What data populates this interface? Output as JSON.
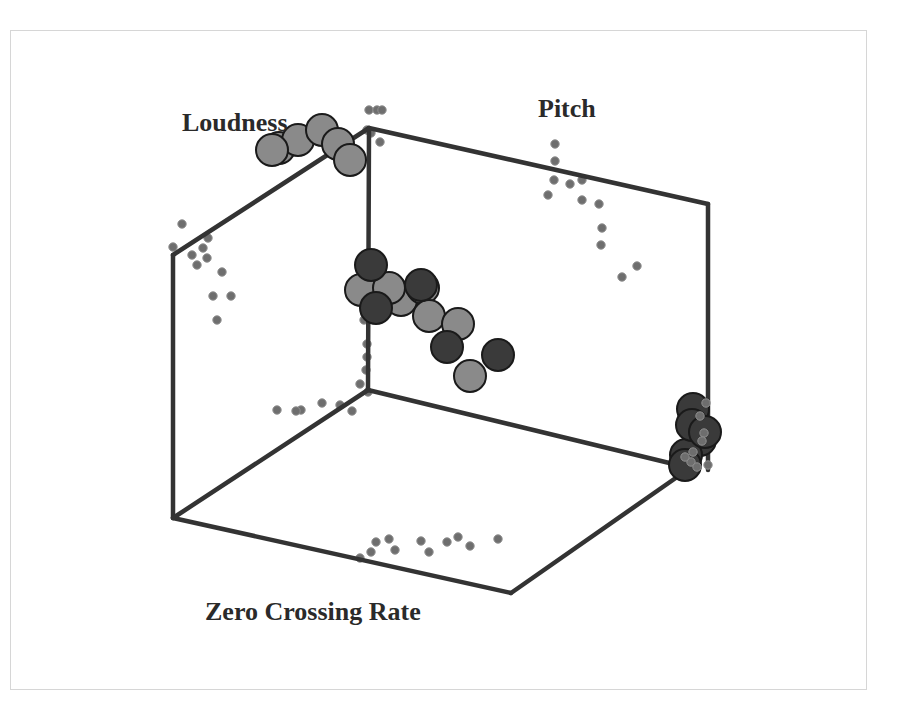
{
  "figure": {
    "axis_labels": {
      "loudness": {
        "text": "Loudness",
        "x": 182,
        "y": 131
      },
      "pitch": {
        "text": "Pitch",
        "x": 538,
        "y": 117
      },
      "zcr": {
        "text": "Zero Crossing Rate",
        "x": 205,
        "y": 620
      }
    },
    "colors": {
      "frame_line": "#333333",
      "light_circle": "#8a8a8a",
      "dark_circle": "#3a3a3a",
      "circle_stroke": "#1a1a1a",
      "projection_dot": "#6e6e6e"
    }
  },
  "chart_data": {
    "type": "scatter",
    "title": "",
    "projection": "3D scatter plot (isometric box)",
    "axes": [
      "Loudness",
      "Pitch",
      "Zero Crossing Rate"
    ],
    "grid": false,
    "legend": null,
    "box_edges": [
      [
        173,
        255,
        369,
        128
      ],
      [
        369,
        128,
        708,
        204
      ],
      [
        173,
        255,
        173,
        518
      ],
      [
        369,
        128,
        368,
        390
      ],
      [
        708,
        204,
        708,
        470
      ],
      [
        173,
        518,
        511,
        593
      ],
      [
        511,
        593,
        690,
        468
      ],
      [
        368,
        390,
        690,
        468
      ],
      [
        173,
        518,
        368,
        390
      ]
    ],
    "series": [
      {
        "name": "cluster-upper-light",
        "shade": "light",
        "points": [
          [
            279,
            148
          ],
          [
            298,
            140
          ],
          [
            322,
            130
          ],
          [
            338,
            144
          ],
          [
            350,
            160
          ],
          [
            272,
            150
          ]
        ]
      },
      {
        "name": "cluster-center-light",
        "shade": "light",
        "points": [
          [
            361,
            290
          ],
          [
            393,
            293
          ],
          [
            401,
            300
          ],
          [
            423,
            288
          ],
          [
            429,
            316
          ],
          [
            458,
            324
          ],
          [
            470,
            376
          ],
          [
            389,
            288
          ]
        ]
      },
      {
        "name": "cluster-center-dark",
        "shade": "dark",
        "points": [
          [
            371,
            265
          ],
          [
            376,
            308
          ],
          [
            421,
            285
          ],
          [
            447,
            347
          ],
          [
            498,
            355
          ]
        ]
      },
      {
        "name": "cluster-right-dark",
        "shade": "dark",
        "points": [
          [
            693,
            409
          ],
          [
            700,
            440
          ],
          [
            686,
            455
          ],
          [
            692,
            425
          ],
          [
            705,
            432
          ],
          [
            685,
            465
          ]
        ]
      }
    ],
    "projections": {
      "loudness_wall": [
        [
          182,
          224
        ],
        [
          173,
          247
        ],
        [
          192,
          255
        ],
        [
          203,
          248
        ],
        [
          208,
          238
        ],
        [
          197,
          265
        ],
        [
          207,
          258
        ],
        [
          222,
          272
        ],
        [
          213,
          296
        ],
        [
          231,
          296
        ],
        [
          217,
          320
        ]
      ],
      "pitch_wall": [
        [
          555,
          144
        ],
        [
          555,
          161
        ],
        [
          554,
          180
        ],
        [
          570,
          184
        ],
        [
          582,
          180
        ],
        [
          548,
          195
        ],
        [
          582,
          200
        ],
        [
          599,
          204
        ],
        [
          602,
          228
        ],
        [
          601,
          245
        ],
        [
          637,
          266
        ],
        [
          622,
          277
        ]
      ],
      "floor": [
        [
          360,
          558
        ],
        [
          371,
          552
        ],
        [
          376,
          542
        ],
        [
          389,
          539
        ],
        [
          395,
          550
        ],
        [
          421,
          541
        ],
        [
          429,
          552
        ],
        [
          447,
          542
        ],
        [
          458,
          537
        ],
        [
          470,
          546
        ],
        [
          498,
          539
        ]
      ],
      "back_vertical": [
        [
          367,
          130
        ],
        [
          371,
          133
        ],
        [
          380,
          142
        ],
        [
          364,
          320
        ],
        [
          367,
          344
        ],
        [
          367,
          357
        ],
        [
          366,
          370
        ],
        [
          360,
          384
        ],
        [
          368,
          392
        ],
        [
          340,
          405
        ],
        [
          352,
          411
        ],
        [
          322,
          403
        ],
        [
          301,
          410
        ],
        [
          296,
          411
        ],
        [
          277,
          410
        ],
        [
          369,
          110
        ],
        [
          377,
          110
        ],
        [
          382,
          110
        ]
      ],
      "right_cluster_dots": [
        [
          706,
          403
        ],
        [
          700,
          416
        ],
        [
          704,
          433
        ],
        [
          702,
          441
        ],
        [
          693,
          452
        ],
        [
          691,
          462
        ],
        [
          697,
          467
        ],
        [
          708,
          465
        ],
        [
          685,
          457
        ]
      ]
    }
  }
}
